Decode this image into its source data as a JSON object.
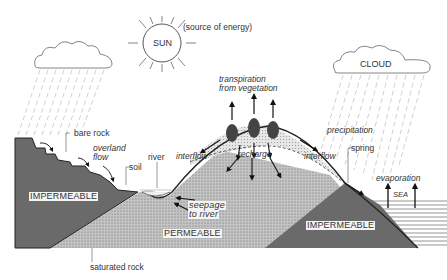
{
  "diagram": {
    "colors": {
      "impermeable": "#6a6a6a",
      "permeable": "#b4b4b4",
      "recharge_zone": "#dcdcdc",
      "sea_lines": "#777777",
      "outline": "#222222",
      "rain": "#bbbbbb"
    },
    "labels": {
      "sun": "SUN",
      "sun_note": "(source of energy)",
      "cloud": "CLOUD",
      "transpiration_line1": "transpiration",
      "transpiration_line2": "from vegetation",
      "precipitation": "precipitation",
      "bare_rock": "bare rock",
      "overland_flow_line1": "overland",
      "overland_flow_line2": "flow",
      "soil": "soil",
      "river": "river",
      "interflow_left": "interflow",
      "recharge": "recharge",
      "interflow_right": "interflow",
      "spring": "spring",
      "evaporation": "evaporation",
      "sea": "SEA",
      "impermeable_left": "IMPERMEABLE",
      "seepage_line1": "seepage",
      "seepage_line2": "to river",
      "permeable": "PERMEABLE",
      "impermeable_right": "IMPERMEABLE",
      "saturated_rock": "saturated rock"
    }
  }
}
